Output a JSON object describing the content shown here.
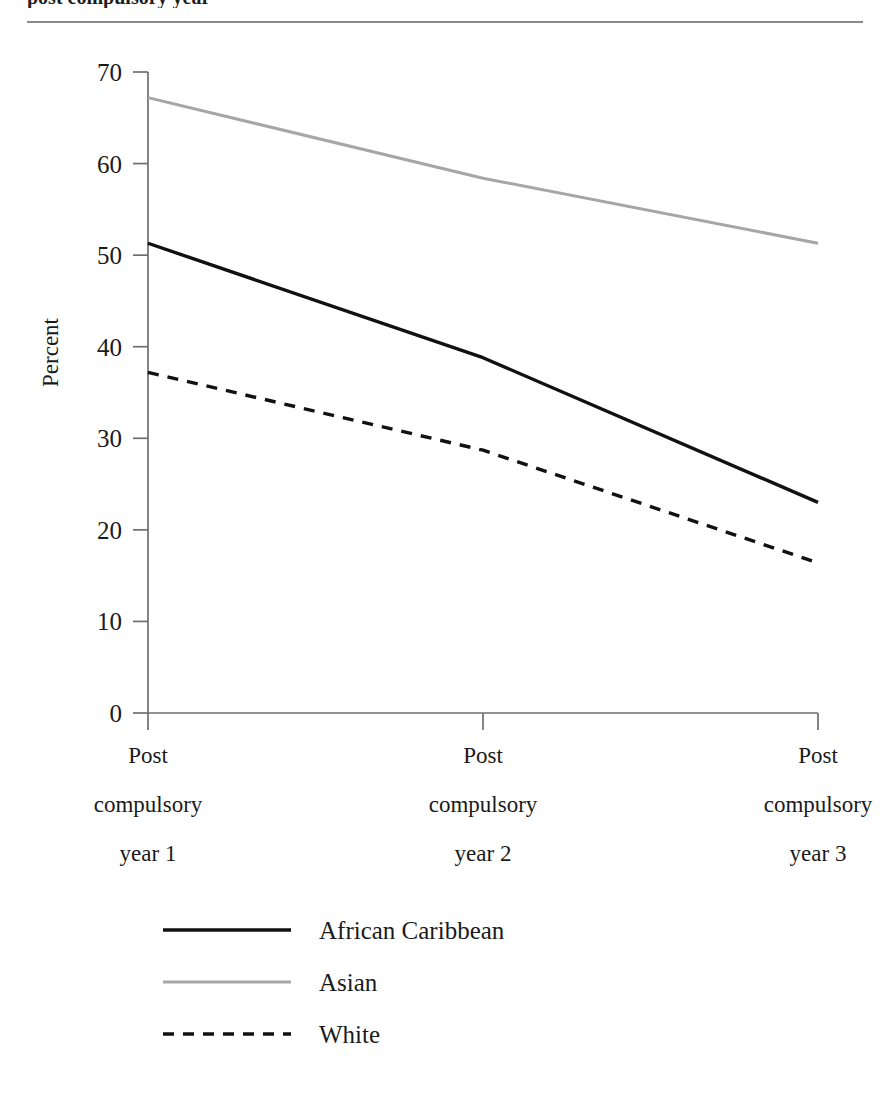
{
  "caption": {
    "text": "post compulsory year"
  },
  "chart_data": {
    "type": "line",
    "title": "",
    "xlabel": "",
    "ylabel": "Percent",
    "ylim": [
      0,
      70
    ],
    "yticks": [
      0,
      10,
      20,
      30,
      40,
      50,
      60,
      70
    ],
    "ytick_labels": [
      "0",
      "10",
      "20",
      "30",
      "40",
      "50",
      "60",
      "70"
    ],
    "grid": false,
    "legend_position": "bottom-left",
    "categories": [
      "Post compulsory year 1",
      "Post compulsory year 2",
      "Post compulsory year 3"
    ],
    "category_lines": [
      [
        "Post",
        "compulsory",
        "year 1"
      ],
      [
        "Post",
        "compulsory",
        "year 2"
      ],
      [
        "Post",
        "compulsory",
        "year 3"
      ]
    ],
    "series": [
      {
        "name": "African Caribbean",
        "values": [
          51.3,
          38.8,
          23.0
        ],
        "color": "#111111",
        "style": "solid",
        "width": 3.4
      },
      {
        "name": "Asian",
        "values": [
          67.2,
          58.4,
          51.3
        ],
        "color": "#a6a6a6",
        "style": "solid",
        "width": 3.0
      },
      {
        "name": "White",
        "values": [
          37.2,
          28.7,
          16.4
        ],
        "color": "#111111",
        "style": "dotted",
        "width": 3.4
      }
    ]
  },
  "legend": {
    "items": [
      {
        "label": "African Caribbean"
      },
      {
        "label": "Asian"
      },
      {
        "label": "White"
      }
    ]
  }
}
